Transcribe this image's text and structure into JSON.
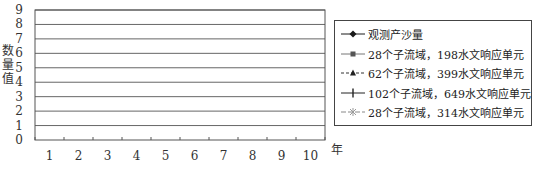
{
  "chart_data": {
    "type": "line",
    "title": "",
    "xlabel": "年",
    "ylabel": "数量值",
    "ylim": [
      0,
      9
    ],
    "yticks": [
      0,
      1,
      2,
      3,
      4,
      5,
      6,
      7,
      8,
      9
    ],
    "categories": [
      "1",
      "2",
      "3",
      "4",
      "5",
      "6",
      "7",
      "8",
      "9",
      "10"
    ],
    "grid": true,
    "legend_position": "right",
    "series": [
      {
        "name": "观测产沙量",
        "marker": "diamond",
        "dash": "solid",
        "color": "#1a1a1a",
        "values": [
          2.8,
          7.1,
          2.0,
          4.9,
          4.5,
          3.1,
          4.9,
          8.2,
          4.3,
          1.5
        ]
      },
      {
        "name": "28个子流域，198水文响应单元",
        "marker": "square",
        "dash": "solid",
        "color": "#777777",
        "values": [
          3.9,
          7.1,
          3.1,
          5.8,
          5.0,
          5.0,
          6.9,
          7.0,
          5.4,
          3.2
        ]
      },
      {
        "name": "62个子流域，399水文响应单元",
        "marker": "triangle",
        "dash": "dashed",
        "color": "#333333",
        "values": [
          3.6,
          6.2,
          2.8,
          5.1,
          4.5,
          4.5,
          6.2,
          6.2,
          4.7,
          3.0
        ]
      },
      {
        "name": "102个子流域，649水文响应单元",
        "marker": "plus",
        "dash": "solid",
        "color": "#222222",
        "values": [
          3.5,
          5.9,
          2.7,
          4.9,
          4.1,
          4.2,
          5.8,
          5.9,
          4.4,
          2.9
        ]
      },
      {
        "name": "28个子流域，314水文响应单元",
        "marker": "star",
        "dash": "longdash",
        "color": "#999999",
        "values": [
          4.1,
          7.3,
          3.2,
          6.0,
          5.1,
          5.1,
          7.2,
          7.3,
          5.6,
          3.3
        ]
      }
    ]
  },
  "axis": {
    "ylabel_chars": [
      "数",
      "量",
      "值"
    ],
    "xunit": "年"
  },
  "legend": {
    "items": [
      {
        "label": "观测产沙量"
      },
      {
        "label": "28个子流域，198水文响应单元"
      },
      {
        "label": "62个子流域，399水文响应单元"
      },
      {
        "label": "102个子流域，649水文响应单元"
      },
      {
        "label": "28个子流域，314水文响应单元"
      }
    ]
  }
}
